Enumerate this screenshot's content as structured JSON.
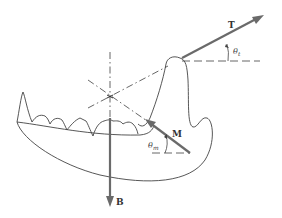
{
  "diagram": {
    "vectors": [
      {
        "id": "T",
        "label": "T",
        "angle_label": "θ",
        "angle_sub": "t",
        "color": "#666666"
      },
      {
        "id": "M",
        "label": "M",
        "angle_label": "θ",
        "angle_sub": "m",
        "color": "#666666"
      },
      {
        "id": "B",
        "label": "B",
        "color": "#666666"
      }
    ],
    "colors": {
      "outline": "#444444",
      "vector": "#6a6a6a",
      "dashed": "#555555"
    }
  }
}
